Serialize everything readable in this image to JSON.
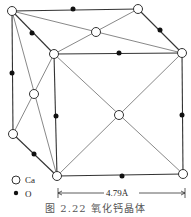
{
  "figure": {
    "caption": "图 2.22  氧化钙晶体",
    "dimension_label": "4.79Å",
    "legend": [
      {
        "symbol": "open-circle",
        "label": "Ca"
      },
      {
        "symbol": "filled-circle",
        "label": "O"
      }
    ]
  },
  "structure": {
    "type": "rock-salt unit cell (CaO)",
    "ca_positions": [
      [
        12,
        11
      ],
      [
        138,
        9
      ],
      [
        96,
        32
      ],
      [
        54,
        54
      ],
      [
        182,
        53
      ],
      [
        34,
        94
      ],
      [
        13,
        134
      ],
      [
        119,
        115
      ],
      [
        57,
        176
      ],
      [
        183,
        174
      ]
    ],
    "o_positions": [
      [
        73,
        9
      ],
      [
        32,
        33
      ],
      [
        160,
        30
      ],
      [
        119,
        53
      ],
      [
        12,
        73
      ],
      [
        56,
        116
      ],
      [
        182,
        115
      ],
      [
        34,
        154
      ],
      [
        122,
        176
      ]
    ]
  },
  "colors": {
    "line": "#333333",
    "ca_fill": "#ffffff",
    "o_fill": "#111111"
  }
}
